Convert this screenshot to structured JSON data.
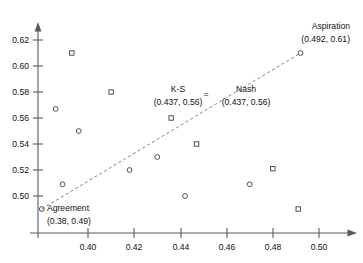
{
  "chart_data": {
    "type": "scatter",
    "title": "",
    "xlabel": "",
    "ylabel": "",
    "xlim": [
      0.378,
      0.512
    ],
    "ylim": [
      0.487,
      0.632
    ],
    "grid": false,
    "legend": "none",
    "xticks": [
      "0.40",
      "0.42",
      "0.44",
      "0.46",
      "0.48",
      "0.50"
    ],
    "xtick_values": [
      0.4,
      0.42,
      0.44,
      0.46,
      0.48,
      0.5
    ],
    "yticks": [
      "0.50",
      "0.52",
      "0.54",
      "0.56",
      "0.58",
      "0.60",
      "0.62"
    ],
    "ytick_values": [
      0.5,
      0.52,
      0.54,
      0.56,
      0.58,
      0.6,
      0.62
    ],
    "series": [
      {
        "name": "circle-markers",
        "marker": "circle",
        "points": [
          {
            "x": 0.38,
            "y": 0.49
          },
          {
            "x": 0.386,
            "y": 0.567
          },
          {
            "x": 0.389,
            "y": 0.509
          },
          {
            "x": 0.396,
            "y": 0.55
          },
          {
            "x": 0.418,
            "y": 0.52
          },
          {
            "x": 0.43,
            "y": 0.53
          },
          {
            "x": 0.442,
            "y": 0.5
          },
          {
            "x": 0.47,
            "y": 0.509
          },
          {
            "x": 0.492,
            "y": 0.61
          }
        ]
      },
      {
        "name": "square-markers",
        "marker": "square",
        "points": [
          {
            "x": 0.393,
            "y": 0.61
          },
          {
            "x": 0.41,
            "y": 0.58
          },
          {
            "x": 0.436,
            "y": 0.56
          },
          {
            "x": 0.447,
            "y": 0.54
          },
          {
            "x": 0.48,
            "y": 0.521
          },
          {
            "x": 0.491,
            "y": 0.49
          }
        ]
      }
    ],
    "trendline": {
      "x1": 0.38,
      "y1": 0.49,
      "x2": 0.492,
      "y2": 0.61
    },
    "annotations": [
      {
        "id": "aspiration",
        "label": "Aspiration",
        "coords": "(0.492, 0.61)",
        "point": {
          "x": 0.492,
          "y": 0.61
        }
      },
      {
        "id": "ks",
        "label": "K-S",
        "coords": "(0.437, 0.56)",
        "point": {
          "x": 0.437,
          "y": 0.56
        }
      },
      {
        "id": "equals",
        "label": "="
      },
      {
        "id": "nash",
        "label": "Nash",
        "coords": "(0.437, 0.56)",
        "point": {
          "x": 0.437,
          "y": 0.56
        }
      },
      {
        "id": "agreement",
        "label": "Agreement",
        "coords": "(0.38, 0.49)",
        "point": {
          "x": 0.38,
          "y": 0.49
        }
      }
    ]
  },
  "axis": {
    "x_tick_0": "0.40",
    "x_tick_1": "0.42",
    "x_tick_2": "0.44",
    "x_tick_3": "0.46",
    "x_tick_4": "0.48",
    "x_tick_5": "0.50",
    "y_tick_0": "0.50",
    "y_tick_1": "0.52",
    "y_tick_2": "0.54",
    "y_tick_3": "0.56",
    "y_tick_4": "0.58",
    "y_tick_5": "0.60",
    "y_tick_6": "0.62"
  },
  "labels": {
    "aspiration_name": "Aspiration",
    "aspiration_coords": "(0.492, 0.61)",
    "ks_name": "K-S",
    "ks_coords": "(0.437, 0.56)",
    "equals_sign": "=",
    "nash_name": "Nash",
    "nash_coords": "(0.437, 0.56)",
    "agreement_name": "Agreement",
    "agreement_coords": "(0.38, 0.49)"
  },
  "colors": {
    "marker_stroke": "#3a3f42",
    "axis": "#555b5e",
    "trendline": "#6e7478",
    "text": "#111111",
    "background": "#ffffff"
  }
}
